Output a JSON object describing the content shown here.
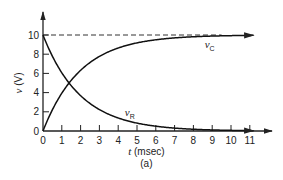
{
  "chart_data": {
    "type": "line",
    "title": "",
    "caption": "(a)",
    "xlabel": "t (msec)",
    "xlabel_var": "t",
    "xlabel_unit": "(msec)",
    "ylabel": "v (V)",
    "ylabel_var": "v",
    "ylabel_unit": "(V)",
    "xlim": [
      0,
      11
    ],
    "ylim": [
      0,
      10
    ],
    "x_ticks": [
      0,
      1,
      2,
      3,
      4,
      5,
      6,
      7,
      8,
      9,
      10,
      11
    ],
    "y_ticks": [
      0,
      2,
      4,
      6,
      8,
      10
    ],
    "grid": false,
    "reference_line": {
      "y": 10,
      "style": "dashed"
    },
    "series": [
      {
        "name": "vC",
        "label_main": "v",
        "label_sub": "C",
        "x": [
          0,
          0.5,
          1,
          1.5,
          2,
          3,
          4,
          5,
          6,
          7,
          8,
          9,
          10,
          11
        ],
        "values": [
          0,
          2.21,
          3.93,
          5.28,
          6.32,
          7.77,
          8.65,
          9.18,
          9.5,
          9.7,
          9.82,
          9.89,
          9.93,
          9.96
        ]
      },
      {
        "name": "vR",
        "label_main": "v",
        "label_sub": "R",
        "x": [
          0,
          0.5,
          1,
          1.5,
          2,
          3,
          4,
          5,
          6,
          7,
          8,
          9,
          10,
          11
        ],
        "values": [
          10,
          7.79,
          6.07,
          4.72,
          3.68,
          2.23,
          1.35,
          0.82,
          0.5,
          0.3,
          0.18,
          0.11,
          0.07,
          0.04
        ]
      }
    ]
  }
}
